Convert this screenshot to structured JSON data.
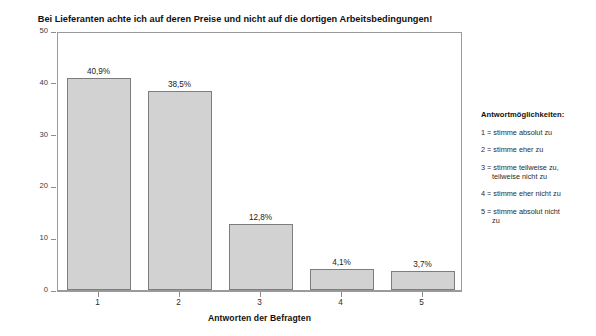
{
  "chart_data": {
    "type": "bar",
    "title": "Bei Lieferanten achte ich auf deren Preise und nicht auf die dortigen Arbeitsbedingungen!",
    "xlabel": "Antworten der Befragten",
    "ylabel": "Prozent",
    "categories": [
      "1",
      "2",
      "3",
      "4",
      "5"
    ],
    "values": [
      40.9,
      38.5,
      12.8,
      4.1,
      3.7
    ],
    "value_labels": [
      "40,9%",
      "38,5%",
      "12,8%",
      "4,1%",
      "3,7%"
    ],
    "ylim": [
      0,
      50
    ],
    "yticks": [
      0,
      10,
      20,
      30,
      40,
      50
    ],
    "ytick_labels": [
      "0",
      "10",
      "20",
      "30",
      "40",
      "50"
    ],
    "grid": false,
    "legend_position": "right",
    "bar_fill_color": "#d2d2d2",
    "bar_border_color": "#7d7d7d"
  },
  "legend": {
    "title": "Antwortmöglichkeiten:",
    "items": [
      {
        "line1": "1 = stimme absolut zu",
        "line2": ""
      },
      {
        "line1": "2 = stimme eher zu",
        "line2": ""
      },
      {
        "line1": "3 = stimme teilweise zu,",
        "line2": "teilweise nicht zu"
      },
      {
        "line1": "4 = stimme eher nicht zu",
        "line2": ""
      },
      {
        "line1": "5 = stimme absolut nicht",
        "line2": "zu"
      }
    ]
  }
}
